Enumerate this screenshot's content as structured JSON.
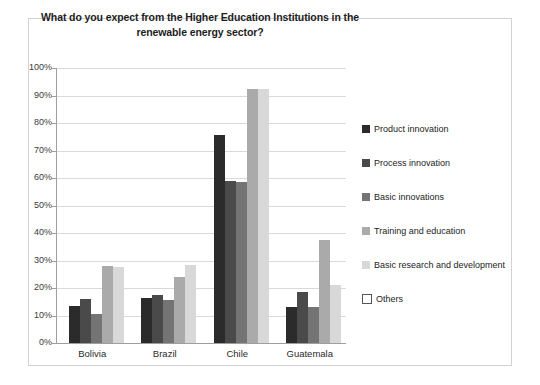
{
  "chart_data": {
    "type": "bar",
    "title": "What do you expect from the Higher Education Institutions in the renewable energy sector?",
    "xlabel": "",
    "ylabel": "",
    "ylim": [
      0,
      100
    ],
    "ytick_labels": [
      "100%",
      "90%",
      "80%",
      "70%",
      "60%",
      "50%",
      "40%",
      "30%",
      "20%",
      "10%",
      "0%"
    ],
    "ytick_values": [
      100,
      90,
      80,
      70,
      60,
      50,
      40,
      30,
      20,
      10,
      0
    ],
    "grid": true,
    "legend_position": "right",
    "categories": [
      "Bolivia",
      "Brazil",
      "Chile",
      "Guatemala"
    ],
    "series": [
      {
        "name": "Product innovation",
        "color": "#2b2b2b",
        "values": [
          13.5,
          16.5,
          75.5,
          13.0
        ]
      },
      {
        "name": "Process innovation",
        "color": "#4a4a4a",
        "values": [
          16.0,
          17.5,
          59.0,
          18.5
        ]
      },
      {
        "name": "Basic innovations",
        "color": "#747474",
        "values": [
          10.5,
          15.5,
          58.5,
          13.0
        ]
      },
      {
        "name": "Training and education",
        "color": "#aaaaaa",
        "values": [
          28.0,
          24.0,
          92.5,
          37.5
        ]
      },
      {
        "name": "Basic research and development",
        "color": "#d8d8d8",
        "values": [
          27.5,
          28.5,
          92.5,
          21.0
        ]
      },
      {
        "name": "Others",
        "color": "#ffffff",
        "values": [
          0,
          0,
          0,
          0
        ]
      }
    ]
  },
  "colors": {
    "frame_border": "#d2d2d2",
    "gridline": "#d9d9d9",
    "axis": "#9e9e9e",
    "title_text": "#1d1d1d",
    "tick_text": "#3b3b3b",
    "background": "#ffffff"
  }
}
